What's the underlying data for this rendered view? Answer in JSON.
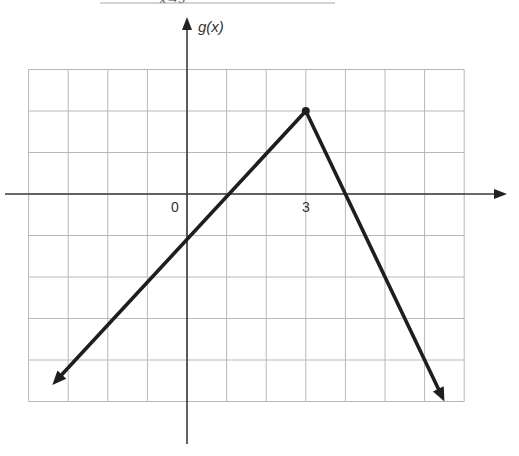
{
  "header": {
    "clipped_text": "x→3"
  },
  "chart_data": {
    "type": "line",
    "title": "",
    "function_name": "g(x)",
    "xlabel": "",
    "ylabel": "g(x)",
    "tick_labels": {
      "origin": "0",
      "x_marked": "3"
    },
    "grid": true,
    "xlim": [
      -4,
      7
    ],
    "ylim": [
      -5,
      3
    ],
    "grid_step": 1,
    "series": [
      {
        "name": "g(x)",
        "description": "piecewise linear; ray toward lower-left, vertex at (3,2) marked with dot, ray toward lower-right",
        "points": [
          {
            "x": -3.4,
            "y": -4.6,
            "arrow": true
          },
          {
            "x": 0,
            "y": -1
          },
          {
            "x": 1,
            "y": 0
          },
          {
            "x": 3,
            "y": 2,
            "marker": "dot"
          },
          {
            "x": 4,
            "y": 0
          },
          {
            "x": 6.5,
            "y": -5,
            "arrow": true
          }
        ]
      }
    ],
    "key_points": [
      {
        "x": 0,
        "y": -1,
        "label": "y-intercept"
      },
      {
        "x": 3,
        "y": 2,
        "label": "vertex"
      }
    ],
    "colors": {
      "line": "#1e1e1e",
      "axis": "#3a3a3a",
      "grid": "#b8b8b8"
    }
  }
}
